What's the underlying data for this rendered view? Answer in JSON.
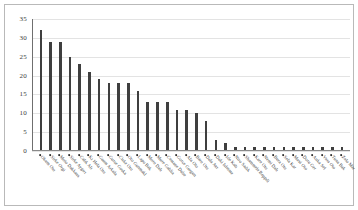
{
  "chart_data": {
    "type": "bar",
    "title": "",
    "subtitle": "",
    "xlabel": "",
    "ylabel": "",
    "ylim": [
      0,
      35
    ],
    "yticks": [
      0,
      5,
      10,
      15,
      20,
      25,
      30,
      35
    ],
    "grid": true,
    "legend": false,
    "legend_position": "none",
    "bar_color": "#3f3f3f",
    "grid_color": "#e3e3e3",
    "label_rotation": 48,
    "label_marker": "bullet",
    "categories": [
      "Okum Oto",
      "Sirke Orgi",
      "Moto Dakkans",
      "Sirke Aygırı",
      "Calık Alı",
      "Kı Hela Oto",
      "Gaum Arkala",
      "Gurse Goska",
      "Ciske Oto",
      "Oto Gunmakl",
      "Lapo Bak",
      "Moro Dalı",
      "Mure Galdia",
      "Cemane Dube",
      "Gorce Gurgun",
      "Ala Oto",
      "Baro Oto",
      "Dala Avr",
      "Daki Isletme",
      "Ide Kalı",
      "Niro Sadık",
      "Shammele Beppdi",
      "Kare Oto",
      "Nemi Dalı",
      "Bura Oto",
      "Sela Kar",
      "Mavi Oto",
      "Doru Ger",
      "Anka Sel",
      "Vera Oto",
      "Tuna Bak",
      "Zelo Mar"
    ],
    "values": [
      32,
      29,
      29,
      25,
      23,
      21,
      19,
      18,
      18,
      18,
      16,
      13,
      13,
      13,
      11,
      11,
      10,
      8,
      3,
      2,
      1,
      1,
      1,
      1,
      1,
      1,
      1,
      1,
      1,
      1,
      1,
      1
    ]
  }
}
